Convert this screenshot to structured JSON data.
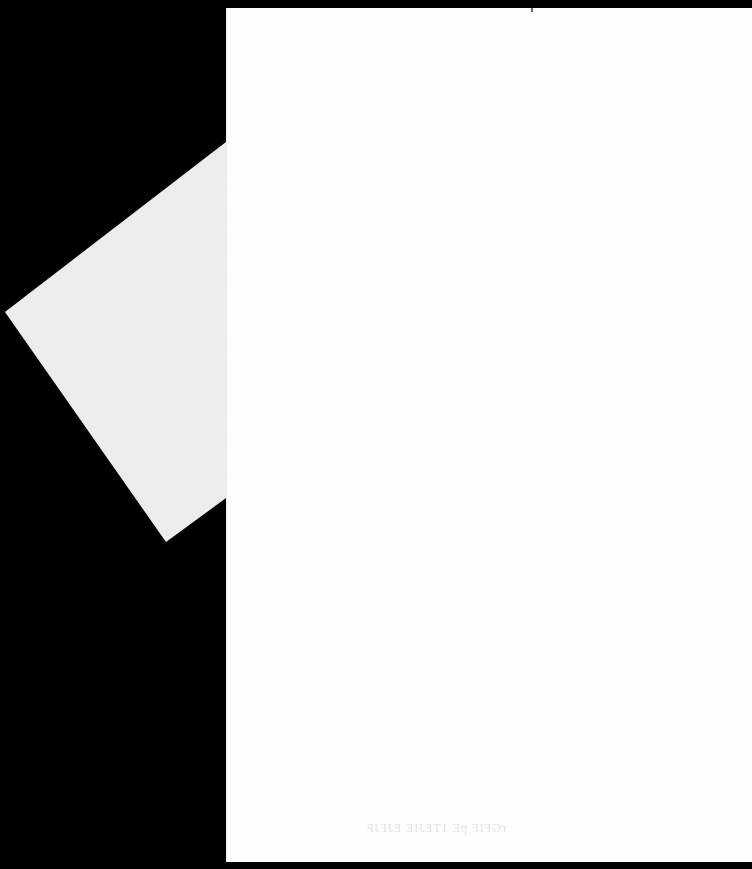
{
  "scan": {
    "background_color": "#000000",
    "page_color": "#fdfdfd",
    "back_sheet_color": "#e9e9e9"
  },
  "page": {
    "content": "",
    "bleed_through_text": "rGFIF pE 1TEJIE EJFJP"
  }
}
